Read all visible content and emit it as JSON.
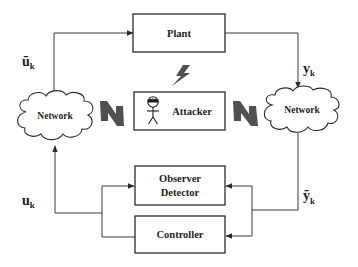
{
  "diagram": {
    "blocks": {
      "plant": {
        "label": "Plant"
      },
      "attacker": {
        "label": "Attacker"
      },
      "observer_detector": {
        "line1": "Observer",
        "line2": "Detector"
      },
      "controller": {
        "label": "Controller"
      }
    },
    "clouds": {
      "left": {
        "label": "Network"
      },
      "right": {
        "label": "Network"
      }
    },
    "signals": {
      "u_tilde": {
        "base": "ũ",
        "sub": "k"
      },
      "y": {
        "base": "y",
        "sub": "k"
      },
      "y_tilde": {
        "base": "ỹ",
        "sub": "k"
      },
      "u": {
        "base": "u",
        "sub": "k"
      }
    },
    "icons": {
      "attacker_figure": "masked-stickman-icon",
      "attack_bolts": [
        "lightning-bolt-icon",
        "lightning-bolt-icon",
        "lightning-bolt-icon"
      ]
    },
    "colors": {
      "line": "#3a3a3a",
      "bolt": "#505050",
      "background": "#ffffff"
    }
  }
}
